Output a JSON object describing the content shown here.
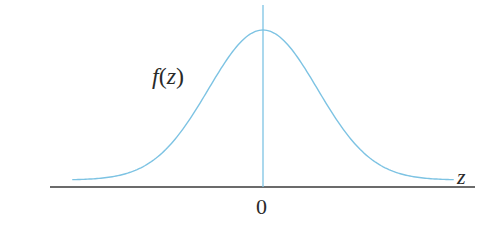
{
  "figure": {
    "function_label": {
      "name": "f",
      "open": "(",
      "variable": "z",
      "close": ")"
    },
    "x_axis_label": "z",
    "origin_tick_label": "0",
    "colors": {
      "curve": "#7dc3e3",
      "vertical_axis": "#7dc3e3",
      "horizontal_axis": "#3a3a3a",
      "text": "#2a2a2a",
      "background": "#ffffff"
    }
  },
  "chart_data": {
    "type": "line",
    "title": "",
    "xlabel": "z",
    "ylabel": "f(z)",
    "x_ticks": [
      "0"
    ],
    "series": [
      {
        "name": "f(z)",
        "shape": "normal density (bell curve)",
        "x": [
          -3.5,
          -3,
          -2.5,
          -2,
          -1.5,
          -1,
          -0.5,
          0,
          0.5,
          1,
          1.5,
          2,
          2.5,
          3,
          3.5
        ],
        "values": [
          0.0009,
          0.0044,
          0.0175,
          0.054,
          0.1295,
          0.242,
          0.3521,
          0.3989,
          0.3521,
          0.242,
          0.1295,
          0.054,
          0.0175,
          0.0044,
          0.0009
        ]
      }
    ],
    "xlim": [
      -3.5,
      3.5
    ],
    "grid": false,
    "legend": "none",
    "annotations": [
      "f(z) label left of curve",
      "z label at right end of horizontal axis",
      "0 below vertical axis"
    ]
  }
}
